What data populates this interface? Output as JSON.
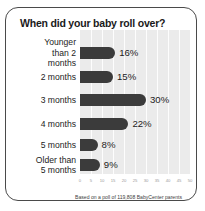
{
  "chart_data": {
    "type": "bar",
    "orientation": "horizontal",
    "title": "When did your baby roll over?",
    "categories": [
      "Younger\nthan 2\nmonths",
      "2 months",
      "3 months",
      "4 months",
      "5 months",
      "Older than\n5 months"
    ],
    "values": [
      16,
      15,
      30,
      22,
      8,
      9
    ],
    "value_labels": [
      "16%",
      "15%",
      "30%",
      "22%",
      "8%",
      "9%"
    ],
    "xlabel": "",
    "ylabel": "",
    "xlim": [
      0,
      50
    ],
    "tick_labels": [
      "0",
      "5",
      "10",
      "15",
      "20",
      "25",
      "30",
      "35",
      "40",
      "45",
      "50"
    ],
    "grid": true,
    "legend": false,
    "footnote": "Based on a poll of 119,808 BabyCenter parents",
    "colors": {
      "bar": "#3b3b3b",
      "plot_background": "#ebebeb",
      "gridline": "#fdfdfd",
      "text": "#1c1c1c",
      "border": "#4a4a4a"
    }
  }
}
